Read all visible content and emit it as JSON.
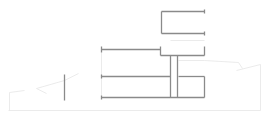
{
  "diagram": {
    "type": "architectural-section",
    "colors": {
      "background": "#ffffff",
      "main_line": "#8a8a8a",
      "faint_line": "#e6e6e6"
    },
    "main_lines": [
      {
        "name": "upper-box-top",
        "x1": 161,
        "y1": 11,
        "x2": 204,
        "y2": 11
      },
      {
        "name": "upper-box-bottom",
        "x1": 161,
        "y1": 33,
        "x2": 204,
        "y2": 33
      },
      {
        "name": "upper-box-left",
        "x1": 161,
        "y1": 11,
        "x2": 161,
        "y2": 33
      },
      {
        "name": "upper-box-right-tick-top",
        "x1": 204,
        "y1": 9,
        "x2": 204,
        "y2": 13
      },
      {
        "name": "upper-box-right-tick-bottom",
        "x1": 204,
        "y1": 31,
        "x2": 204,
        "y2": 35
      },
      {
        "name": "roof-left",
        "x1": 101,
        "y1": 49,
        "x2": 160,
        "y2": 49
      },
      {
        "name": "roof-left-tick",
        "x1": 101,
        "y1": 46,
        "x2": 101,
        "y2": 52
      },
      {
        "name": "roof-step",
        "x1": 160,
        "y1": 46,
        "x2": 160,
        "y2": 55
      },
      {
        "name": "roof-right",
        "x1": 160,
        "y1": 55,
        "x2": 204,
        "y2": 55
      },
      {
        "name": "roof-right-tick",
        "x1": 204,
        "y1": 46,
        "x2": 204,
        "y2": 55
      },
      {
        "name": "floor-mid-left",
        "x1": 101,
        "y1": 76,
        "x2": 170,
        "y2": 76
      },
      {
        "name": "floor-mid-right",
        "x1": 178,
        "y1": 76,
        "x2": 204,
        "y2": 76
      },
      {
        "name": "floor-mid-left-tick",
        "x1": 101,
        "y1": 74,
        "x2": 101,
        "y2": 78
      },
      {
        "name": "ground-floor",
        "x1": 101,
        "y1": 97,
        "x2": 204,
        "y2": 97
      },
      {
        "name": "ground-floor-left-tick",
        "x1": 101,
        "y1": 95,
        "x2": 101,
        "y2": 99
      },
      {
        "name": "column-left",
        "x1": 170,
        "y1": 55,
        "x2": 170,
        "y2": 97
      },
      {
        "name": "column-right",
        "x1": 177,
        "y1": 55,
        "x2": 177,
        "y2": 97
      },
      {
        "name": "wall-right",
        "x1": 204,
        "y1": 76,
        "x2": 204,
        "y2": 97
      },
      {
        "name": "standalone-post",
        "x1": 64,
        "y1": 74,
        "x2": 64,
        "y2": 100
      }
    ],
    "faint_lines": [
      {
        "name": "wall-left-faint",
        "x1": 101,
        "y1": 52,
        "x2": 101,
        "y2": 95
      },
      {
        "name": "ground-line",
        "x1": 8,
        "y1": 110,
        "x2": 260,
        "y2": 110
      },
      {
        "name": "terrain-left-vertical",
        "x1": 9,
        "y1": 92,
        "x2": 9,
        "y2": 110
      },
      {
        "name": "terrain-left-a",
        "x1": 9,
        "y1": 92,
        "x2": 24,
        "y2": 90
      },
      {
        "name": "terrain-left-b",
        "x1": 36,
        "y1": 88,
        "x2": 64,
        "y2": 80
      },
      {
        "name": "terrain-left-c",
        "x1": 36,
        "y1": 88,
        "x2": 46,
        "y2": 93
      },
      {
        "name": "terrain-left-d",
        "x1": 64,
        "y1": 80,
        "x2": 78,
        "y2": 73
      },
      {
        "name": "terrain-right-a",
        "x1": 204,
        "y1": 60,
        "x2": 238,
        "y2": 62
      },
      {
        "name": "terrain-right-b",
        "x1": 238,
        "y1": 62,
        "x2": 242,
        "y2": 68
      },
      {
        "name": "terrain-right-c",
        "x1": 236,
        "y1": 70,
        "x2": 260,
        "y2": 64
      },
      {
        "name": "terrain-right-vertical",
        "x1": 260,
        "y1": 64,
        "x2": 260,
        "y2": 110
      },
      {
        "name": "interior-faint-upper",
        "x1": 170,
        "y1": 40,
        "x2": 204,
        "y2": 40
      },
      {
        "name": "interior-faint-right-room",
        "x1": 178,
        "y1": 60,
        "x2": 204,
        "y2": 60
      }
    ]
  }
}
